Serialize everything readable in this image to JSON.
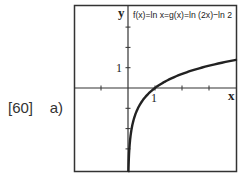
{
  "problem_label": "[60]    a)",
  "chart_data": {
    "type": "line",
    "title": "f(x)=ln x=g(x)=ln (2x)−ln 2",
    "xlabel": "x",
    "ylabel": "y",
    "xlim": [
      -2,
      4
    ],
    "ylim": [
      -4,
      4
    ],
    "x_ticks": [
      -1,
      1,
      2,
      3
    ],
    "y_ticks": [
      -3,
      -2,
      -1,
      1,
      2,
      3
    ],
    "x_tick_labels": [
      "1"
    ],
    "y_tick_labels": [
      "1"
    ],
    "grid": false,
    "series": [
      {
        "name": "f(x)=ln x",
        "x": [
          0.02,
          0.05,
          0.1,
          0.2,
          0.3,
          0.5,
          0.75,
          1,
          1.5,
          2,
          2.5,
          3,
          3.5,
          4
        ],
        "values": [
          -3.91,
          -3.0,
          -2.3,
          -1.61,
          -1.2,
          -0.69,
          -0.29,
          0,
          0.41,
          0.69,
          0.92,
          1.1,
          1.25,
          1.39
        ]
      }
    ]
  }
}
